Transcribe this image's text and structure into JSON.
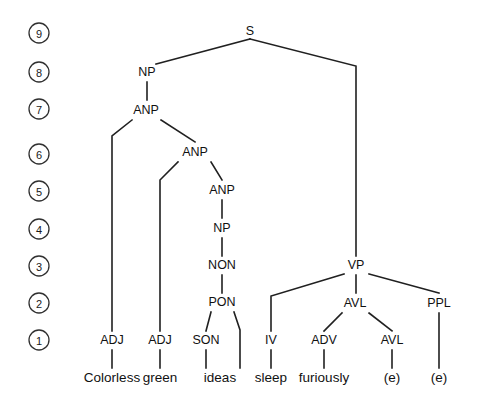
{
  "figure": {
    "kind": "syntax-tree",
    "sentence": "Colorless green ideas sleep furiously",
    "background_color": "#ffffff",
    "line_color": "#202020",
    "text_color": "#111111"
  },
  "levels": [
    {
      "number": "9",
      "y": 33
    },
    {
      "number": "8",
      "y": 72
    },
    {
      "number": "7",
      "y": 109
    },
    {
      "number": "6",
      "y": 154
    },
    {
      "number": "5",
      "y": 191
    },
    {
      "number": "4",
      "y": 229
    },
    {
      "number": "3",
      "y": 266
    },
    {
      "number": "2",
      "y": 303
    },
    {
      "number": "1",
      "y": 340
    }
  ],
  "level_axis": {
    "x": 39,
    "radius": 10
  },
  "nodes": [
    {
      "id": "S",
      "label": "S",
      "x": 250,
      "y": 31,
      "level": 9
    },
    {
      "id": "NP1",
      "label": "NP",
      "x": 147,
      "y": 72,
      "level": 8
    },
    {
      "id": "ANP1",
      "label": "ANP",
      "x": 146,
      "y": 110,
      "level": 7
    },
    {
      "id": "ANP2",
      "label": "ANP",
      "x": 195,
      "y": 152,
      "level": 6
    },
    {
      "id": "ANP3",
      "label": "ANP",
      "x": 222,
      "y": 190,
      "level": 5
    },
    {
      "id": "NP2",
      "label": "NP",
      "x": 222,
      "y": 228,
      "level": 4
    },
    {
      "id": "NON",
      "label": "NON",
      "x": 222,
      "y": 265,
      "level": 3
    },
    {
      "id": "PON",
      "label": "PON",
      "x": 222,
      "y": 302,
      "level": 2
    },
    {
      "id": "SON",
      "label": "SON",
      "x": 206,
      "y": 340,
      "level": 1
    },
    {
      "id": "ADJ1",
      "label": "ADJ",
      "x": 112,
      "y": 340,
      "level": 1
    },
    {
      "id": "ADJ2",
      "label": "ADJ",
      "x": 160,
      "y": 340,
      "level": 1
    },
    {
      "id": "VP",
      "label": "VP",
      "x": 356,
      "y": 265,
      "level": 3
    },
    {
      "id": "AVL1",
      "label": "AVL",
      "x": 355,
      "y": 303,
      "level": 2
    },
    {
      "id": "PPL",
      "label": "PPL",
      "x": 439,
      "y": 303,
      "level": 2
    },
    {
      "id": "IV",
      "label": "IV",
      "x": 271,
      "y": 340,
      "level": 1
    },
    {
      "id": "ADV",
      "label": "ADV",
      "x": 324,
      "y": 340,
      "level": 1
    },
    {
      "id": "AVL2",
      "label": "AVL",
      "x": 392,
      "y": 340,
      "level": 1
    }
  ],
  "leaves": [
    {
      "id": "w1",
      "word": "Colorless",
      "x": 112,
      "y": 377
    },
    {
      "id": "w2",
      "word": "green",
      "x": 160,
      "y": 377
    },
    {
      "id": "w3",
      "word": "ideas",
      "x": 220,
      "y": 377
    },
    {
      "id": "w4",
      "word": "sleep",
      "x": 271,
      "y": 377
    },
    {
      "id": "w5",
      "word": "furiously",
      "x": 324,
      "y": 377
    },
    {
      "id": "w6",
      "word": "(e)",
      "x": 392,
      "y": 377
    },
    {
      "id": "w7",
      "word": "(e)",
      "x": 439,
      "y": 377
    }
  ],
  "edges": [
    {
      "from": "S",
      "to": "NP1",
      "points": "250,39 156,64"
    },
    {
      "from": "S",
      "to": "VP",
      "points": "250,39 356,66 356,256"
    },
    {
      "from": "NP1",
      "to": "ANP1",
      "points": "147,82 147,100"
    },
    {
      "from": "ANP1",
      "to": "ADJ1",
      "points": "132,120 112,136 112,331"
    },
    {
      "from": "ANP1",
      "to": "ANP2",
      "points": "161,120 195,142"
    },
    {
      "from": "ANP2",
      "to": "ADJ2",
      "points": "178,162 160,180 160,331"
    },
    {
      "from": "ANP2",
      "to": "ANP3",
      "points": "211,162 222,180"
    },
    {
      "from": "ANP3",
      "to": "NP2",
      "points": "222,200 222,218"
    },
    {
      "from": "NP2",
      "to": "NON",
      "points": "222,238 222,256"
    },
    {
      "from": "NON",
      "to": "PON",
      "points": "222,275 222,293"
    },
    {
      "from": "PON",
      "to": "SON",
      "points": "211,312 206,331"
    },
    {
      "from": "PON",
      "to": "w3",
      "points": "234,312 240,330 240,368"
    },
    {
      "from": "SON",
      "to": "w3",
      "points": "206,350 206,368"
    },
    {
      "from": "ADJ1",
      "to": "w1",
      "points": "112,350 112,368"
    },
    {
      "from": "ADJ2",
      "to": "w2",
      "points": "160,350 160,368"
    },
    {
      "from": "VP",
      "to": "IV",
      "points": "344,274 271,296 271,331"
    },
    {
      "from": "VP",
      "to": "AVL1",
      "points": "356,275 356,293"
    },
    {
      "from": "VP",
      "to": "PPL",
      "points": "369,274 439,293"
    },
    {
      "from": "AVL1",
      "to": "ADV",
      "points": "342,313 324,331"
    },
    {
      "from": "AVL1",
      "to": "AVL2",
      "points": "369,313 392,331"
    },
    {
      "from": "PPL",
      "to": "w7",
      "points": "439,313 439,368"
    },
    {
      "from": "IV",
      "to": "w4",
      "points": "271,350 271,368"
    },
    {
      "from": "ADV",
      "to": "w5",
      "points": "324,350 324,368"
    },
    {
      "from": "AVL2",
      "to": "w6",
      "points": "392,350 392,368"
    }
  ]
}
